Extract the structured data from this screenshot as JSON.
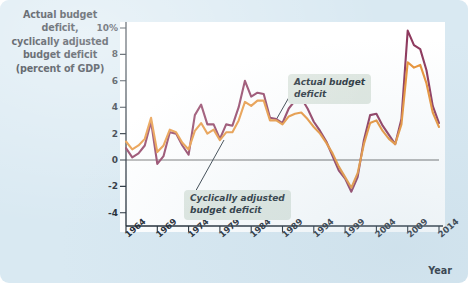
{
  "figure": {
    "background_color": "#d9e9f2",
    "plot_background_color": "#ffffff"
  },
  "y_axis": {
    "title_lines": [
      "Actual budget deficit,",
      "cyclically adjusted",
      "budget deficit",
      "(percent of GDP)"
    ],
    "tick_labels": [
      "10%",
      "8",
      "6",
      "4",
      "2",
      "0",
      "-2",
      "-4"
    ]
  },
  "x_axis": {
    "label": "Year",
    "tick_labels": [
      "1964",
      "1969",
      "1974",
      "1979",
      "1984",
      "1989",
      "1994",
      "1999",
      "2004",
      "2009",
      "2014"
    ]
  },
  "callouts": {
    "actual": [
      "Actual budget",
      "deficit"
    ],
    "adjusted": [
      "Cyclically adjusted",
      "budget deficit"
    ]
  },
  "chart_data": {
    "type": "line",
    "title": "Actual budget deficit, cyclically adjusted budget deficit (percent of GDP)",
    "xlabel": "Year",
    "ylabel": "percent of GDP",
    "xlim": [
      1964,
      2014
    ],
    "ylim": [
      -5,
      10
    ],
    "yticks": [
      10,
      8,
      6,
      4,
      2,
      0,
      -2,
      -4
    ],
    "xticks": [
      1964,
      1969,
      1974,
      1979,
      1984,
      1989,
      1994,
      1999,
      2004,
      2009,
      2014
    ],
    "grid": false,
    "legend": "annotations",
    "colors": {
      "actual_budget_deficit": "#8e3a5e",
      "cyclically_adjusted_budget_deficit": "#e8943a",
      "zero_line": "#6b6b6b",
      "axis": "#1b2630"
    },
    "x": [
      1964,
      1965,
      1966,
      1967,
      1968,
      1969,
      1970,
      1971,
      1972,
      1973,
      1974,
      1975,
      1976,
      1977,
      1978,
      1979,
      1980,
      1981,
      1982,
      1983,
      1984,
      1985,
      1986,
      1987,
      1988,
      1989,
      1990,
      1991,
      1992,
      1993,
      1994,
      1995,
      1996,
      1997,
      1998,
      1999,
      2000,
      2001,
      2002,
      2003,
      2004,
      2005,
      2006,
      2007,
      2008,
      2009,
      2010,
      2011,
      2012,
      2013,
      2014
    ],
    "series": [
      {
        "name": "Actual budget deficit",
        "color": "#8e3a5e",
        "values": [
          0.9,
          0.2,
          0.5,
          1.1,
          2.9,
          -0.3,
          0.3,
          2.1,
          2.0,
          1.1,
          0.4,
          3.4,
          4.2,
          2.7,
          2.7,
          1.6,
          2.7,
          2.6,
          4.0,
          6.0,
          4.8,
          5.1,
          5.0,
          3.2,
          3.1,
          2.8,
          3.9,
          4.5,
          4.7,
          3.9,
          2.9,
          2.2,
          1.4,
          0.3,
          -0.8,
          -1.4,
          -2.4,
          -1.3,
          1.5,
          3.4,
          3.5,
          2.6,
          1.9,
          1.2,
          3.1,
          9.8,
          8.7,
          8.4,
          6.8,
          4.1,
          2.8
        ]
      },
      {
        "name": "Cyclically adjusted budget deficit",
        "color": "#e8943a",
        "values": [
          1.4,
          0.8,
          1.1,
          1.6,
          3.2,
          0.6,
          1.1,
          2.3,
          2.1,
          1.3,
          0.8,
          2.2,
          2.8,
          2.0,
          2.3,
          1.5,
          2.1,
          2.1,
          3.0,
          4.4,
          4.1,
          4.5,
          4.5,
          3.0,
          3.0,
          2.7,
          3.3,
          3.5,
          3.6,
          3.1,
          2.5,
          2.0,
          1.3,
          0.5,
          -0.5,
          -1.3,
          -2.1,
          -1.0,
          1.2,
          2.8,
          3.0,
          2.2,
          1.6,
          1.2,
          2.7,
          7.4,
          7.0,
          7.2,
          5.8,
          3.6,
          2.5
        ]
      }
    ]
  }
}
